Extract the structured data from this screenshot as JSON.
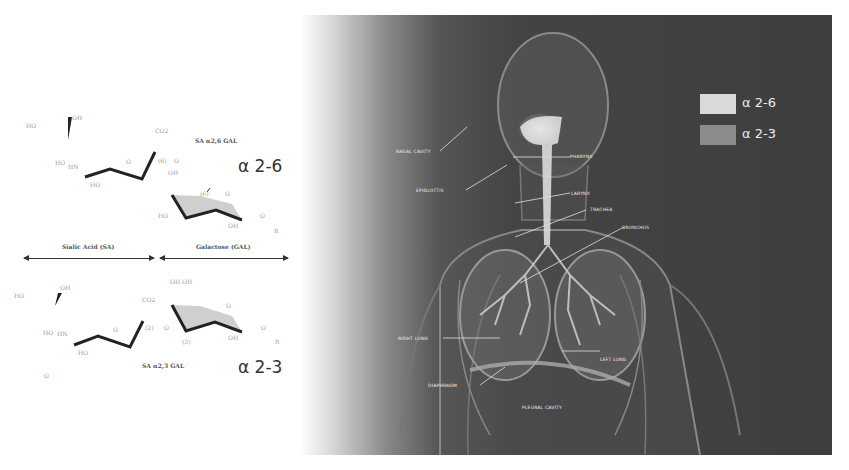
{
  "left_panel": {
    "top_structure": {
      "title": "SA α2,6 GAL",
      "alpha_label": "α 2-6",
      "atoms": [
        "HO",
        "OH",
        "CO2",
        "HO",
        "HN",
        "HO",
        "O",
        "(6)",
        "O",
        "OH",
        "(6)",
        "O",
        "HO",
        "OH",
        "O",
        "R"
      ]
    },
    "divider": {
      "left_label": "Sialic Acid (SA)",
      "right_label": "Galactose (GAL)"
    },
    "bottom_structure": {
      "title": "SA α2,3 GAL",
      "alpha_label": "α 2-3",
      "atoms": [
        "HO",
        "OH",
        "CO2",
        "OH OH",
        "HO",
        "HN",
        "HO",
        "O",
        "(2)",
        "O",
        "(3)",
        "O",
        "OH",
        "O",
        "R"
      ]
    }
  },
  "right_panel": {
    "legend": [
      {
        "label": "α 2-6",
        "color": "#d9d9d9"
      },
      {
        "label": "α 2-3",
        "color": "#8c8c8c"
      }
    ],
    "organ_labels": [
      {
        "label": "NASAL CAVITY"
      },
      {
        "label": "PHARYNX"
      },
      {
        "label": "EPIGLOTTIS"
      },
      {
        "label": "LARYNX"
      },
      {
        "label": "TRACHEA"
      },
      {
        "label": "BRONCHUS"
      },
      {
        "label": "RIGHT LUNG"
      },
      {
        "label": "LEFT LUNG"
      },
      {
        "label": "DIAPHRAGM"
      },
      {
        "label": "PLEURAL CAVITY"
      }
    ]
  }
}
